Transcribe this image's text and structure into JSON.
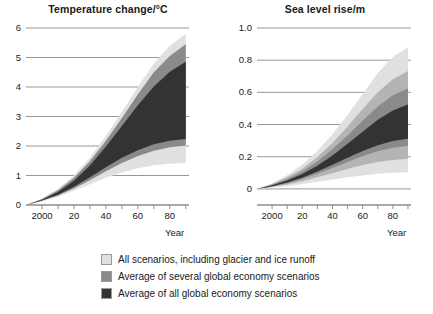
{
  "chart_data": [
    {
      "type": "area",
      "title": "Temperature change/°C",
      "xlabel": "Year",
      "ylabel": "",
      "xlim": [
        1990,
        2092
      ],
      "ylim": [
        0,
        6
      ],
      "yticks": [
        0,
        1,
        2,
        3,
        4,
        5,
        6
      ],
      "ytick_labels": [
        "0",
        "1",
        "2",
        "3",
        "4",
        "5",
        "6"
      ],
      "xticks": [
        2000,
        2010,
        2020,
        2030,
        2040,
        2050,
        2060,
        2070,
        2080,
        2090
      ],
      "xtick_labels": [
        "2000",
        "",
        "20",
        "",
        "40",
        "",
        "60",
        "",
        "80",
        ""
      ],
      "grid": true,
      "legend_position": "below",
      "x": [
        1990,
        2000,
        2010,
        2020,
        2030,
        2040,
        2050,
        2060,
        2070,
        2080,
        2090
      ],
      "series": [
        {
          "name": "All scenarios, including glacier and ice runoff",
          "color": "#e0e0e0",
          "upper": [
            0.0,
            0.22,
            0.55,
            1.0,
            1.6,
            2.35,
            3.15,
            4.0,
            4.8,
            5.4,
            5.8
          ],
          "lower": [
            0.0,
            0.12,
            0.28,
            0.48,
            0.7,
            0.92,
            1.1,
            1.25,
            1.35,
            1.4,
            1.42
          ]
        },
        {
          "name": "Average of several global economy scenarios",
          "color": "#8a8a8a",
          "upper": [
            0.0,
            0.2,
            0.5,
            0.92,
            1.48,
            2.18,
            2.95,
            3.75,
            4.5,
            5.05,
            5.45
          ],
          "lower": [
            0.0,
            0.14,
            0.32,
            0.56,
            0.84,
            1.14,
            1.42,
            1.66,
            1.84,
            1.96,
            2.02
          ]
        },
        {
          "name": "Average of all global economy scenarios",
          "color": "#333333",
          "upper": [
            0.0,
            0.18,
            0.44,
            0.82,
            1.34,
            1.98,
            2.68,
            3.38,
            4.02,
            4.52,
            4.86
          ],
          "lower": [
            0.0,
            0.15,
            0.35,
            0.62,
            0.94,
            1.28,
            1.6,
            1.86,
            2.06,
            2.18,
            2.24
          ]
        }
      ]
    },
    {
      "type": "area",
      "title": "Sea level rise/m",
      "xlabel": "Year",
      "ylabel": "",
      "xlim": [
        1990,
        2092
      ],
      "ylim": [
        -0.1,
        1.0
      ],
      "yticks": [
        0,
        0.2,
        0.4,
        0.6,
        0.8,
        1.0
      ],
      "ytick_labels": [
        "0",
        "0.2",
        "0.4",
        "0.6",
        "0.8",
        "1.0"
      ],
      "xticks": [
        2000,
        2010,
        2020,
        2030,
        2040,
        2050,
        2060,
        2070,
        2080,
        2090
      ],
      "xtick_labels": [
        "2000",
        "",
        "20",
        "",
        "40",
        "",
        "60",
        "",
        "80",
        ""
      ],
      "grid": true,
      "legend_position": "below",
      "x": [
        1990,
        2000,
        2010,
        2020,
        2030,
        2040,
        2050,
        2060,
        2070,
        2080,
        2090
      ],
      "series": [
        {
          "name": "All scenarios, including glacier and ice runoff",
          "color": "#e0e0e0",
          "upper": [
            0.0,
            0.035,
            0.085,
            0.15,
            0.235,
            0.34,
            0.46,
            0.59,
            0.72,
            0.82,
            0.88
          ],
          "lower": [
            0.0,
            0.008,
            0.018,
            0.03,
            0.044,
            0.058,
            0.072,
            0.084,
            0.094,
            0.1,
            0.104
          ]
        },
        {
          "name": "Average of several global economy scenarios",
          "color": "#b4b4b4",
          "upper": [
            0.0,
            0.03,
            0.072,
            0.126,
            0.198,
            0.286,
            0.388,
            0.496,
            0.6,
            0.682,
            0.732
          ],
          "lower": [
            0.0,
            0.012,
            0.028,
            0.048,
            0.072,
            0.098,
            0.124,
            0.148,
            0.168,
            0.18,
            0.188
          ]
        },
        {
          "name": "Average of several global economy scenarios",
          "color": "#8a8a8a",
          "upper": [
            0.0,
            0.026,
            0.062,
            0.108,
            0.17,
            0.246,
            0.332,
            0.424,
            0.512,
            0.582,
            0.624
          ],
          "lower": [
            0.0,
            0.015,
            0.035,
            0.062,
            0.094,
            0.13,
            0.168,
            0.204,
            0.234,
            0.256,
            0.268
          ]
        },
        {
          "name": "Average of all global economy scenarios",
          "color": "#333333",
          "upper": [
            0.0,
            0.022,
            0.052,
            0.092,
            0.144,
            0.208,
            0.28,
            0.356,
            0.43,
            0.488,
            0.524
          ],
          "lower": [
            0.0,
            0.017,
            0.04,
            0.07,
            0.108,
            0.15,
            0.194,
            0.236,
            0.272,
            0.298,
            0.312
          ]
        }
      ]
    }
  ],
  "legend": {
    "items": [
      {
        "label": "All scenarios, including glacier and ice runoff",
        "color": "#e0e0e0"
      },
      {
        "label": "Average of several global economy scenarios",
        "color": "#8a8a8a"
      },
      {
        "label": "Average of all global economy scenarios",
        "color": "#333333"
      }
    ]
  }
}
